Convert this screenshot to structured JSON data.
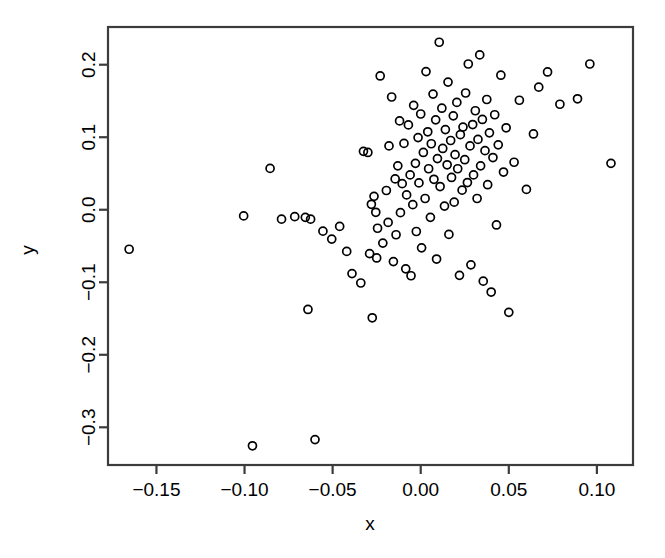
{
  "chart_data": {
    "type": "scatter",
    "title": "",
    "xlabel": "x",
    "ylabel": "y",
    "xlim": [
      -0.1775,
      0.1205
    ],
    "ylim": [
      -0.352,
      0.252
    ],
    "xticks": [
      -0.15,
      -0.1,
      -0.05,
      0.0,
      0.05,
      0.1
    ],
    "xtick_labels": [
      "-0.15",
      "-0.10",
      "-0.05",
      "0.00",
      "0.05",
      "0.10"
    ],
    "yticks": [
      0.2,
      0.1,
      0.0,
      -0.1,
      -0.2,
      -0.3
    ],
    "ytick_labels": [
      "0.2",
      "0.1",
      "0.0",
      "-0.1",
      "-0.2",
      "-0.3"
    ],
    "grid": false,
    "legend": false,
    "marker": "open-circle",
    "marker_size": 8,
    "marker_color": "#000000",
    "n_points": 121,
    "points": [
      [
        -0.1655,
        -0.0545
      ],
      [
        -0.1005,
        -0.0085
      ],
      [
        -0.0955,
        -0.3255
      ],
      [
        -0.0855,
        0.057
      ],
      [
        -0.079,
        -0.013
      ],
      [
        -0.0715,
        -0.0095
      ],
      [
        -0.0655,
        -0.0105
      ],
      [
        -0.064,
        -0.1375
      ],
      [
        -0.0625,
        -0.013
      ],
      [
        -0.06,
        -0.317
      ],
      [
        -0.0555,
        -0.0295
      ],
      [
        -0.0505,
        -0.0405
      ],
      [
        -0.046,
        -0.023
      ],
      [
        -0.042,
        -0.0575
      ],
      [
        -0.039,
        -0.088
      ],
      [
        -0.034,
        -0.101
      ],
      [
        -0.0325,
        0.0805
      ],
      [
        -0.03,
        0.079
      ],
      [
        -0.029,
        -0.0605
      ],
      [
        -0.028,
        0.0075
      ],
      [
        -0.0275,
        -0.149
      ],
      [
        -0.0265,
        0.0185
      ],
      [
        -0.0255,
        -0.0035
      ],
      [
        -0.025,
        -0.0665
      ],
      [
        -0.0245,
        -0.0255
      ],
      [
        -0.023,
        0.1845
      ],
      [
        -0.0215,
        -0.046
      ],
      [
        -0.0195,
        0.0265
      ],
      [
        -0.0185,
        -0.0175
      ],
      [
        -0.018,
        0.088
      ],
      [
        -0.0165,
        0.1555
      ],
      [
        -0.0155,
        -0.0715
      ],
      [
        -0.0145,
        0.0425
      ],
      [
        -0.014,
        -0.0345
      ],
      [
        -0.013,
        0.0605
      ],
      [
        -0.012,
        0.1225
      ],
      [
        -0.0115,
        -0.004
      ],
      [
        -0.0105,
        0.036
      ],
      [
        -0.0095,
        0.0915
      ],
      [
        -0.0085,
        -0.0815
      ],
      [
        -0.008,
        0.0205
      ],
      [
        -0.007,
        0.117
      ],
      [
        -0.006,
        0.048
      ],
      [
        -0.0055,
        -0.091
      ],
      [
        -0.0045,
        0.007
      ],
      [
        -0.004,
        0.144
      ],
      [
        -0.003,
        0.064
      ],
      [
        -0.0025,
        -0.03
      ],
      [
        -0.0015,
        0.0995
      ],
      [
        -0.001,
        0.037
      ],
      [
        0.0,
        0.132
      ],
      [
        0.0005,
        -0.0525
      ],
      [
        0.0015,
        0.079
      ],
      [
        0.0025,
        0.0155
      ],
      [
        0.003,
        0.1905
      ],
      [
        0.004,
        0.1075
      ],
      [
        0.0045,
        0.0565
      ],
      [
        0.0055,
        -0.0105
      ],
      [
        0.006,
        0.091
      ],
      [
        0.007,
        0.1595
      ],
      [
        0.0075,
        0.042
      ],
      [
        0.0085,
        0.124
      ],
      [
        0.009,
        -0.068
      ],
      [
        0.0095,
        0.0705
      ],
      [
        0.0105,
        0.231
      ],
      [
        0.011,
        0.032
      ],
      [
        0.012,
        0.14
      ],
      [
        0.0125,
        0.0845
      ],
      [
        0.0135,
        0.005
      ],
      [
        0.014,
        0.1105
      ],
      [
        0.015,
        0.062
      ],
      [
        0.0155,
        0.176
      ],
      [
        0.016,
        -0.034
      ],
      [
        0.017,
        0.0955
      ],
      [
        0.0175,
        0.0445
      ],
      [
        0.0185,
        0.1295
      ],
      [
        0.019,
        0.0105
      ],
      [
        0.0195,
        0.076
      ],
      [
        0.0205,
        0.148
      ],
      [
        0.021,
        0.0565
      ],
      [
        0.022,
        -0.0905
      ],
      [
        0.0225,
        0.1035
      ],
      [
        0.0235,
        0.027
      ],
      [
        0.024,
        0.114
      ],
      [
        0.025,
        0.069
      ],
      [
        0.0255,
        0.161
      ],
      [
        0.0265,
        0.0375
      ],
      [
        0.027,
        0.201
      ],
      [
        0.028,
        0.088
      ],
      [
        0.0285,
        -0.076
      ],
      [
        0.0295,
        0.1175
      ],
      [
        0.03,
        0.048
      ],
      [
        0.031,
        0.1365
      ],
      [
        0.032,
        0.0155
      ],
      [
        0.0325,
        0.097
      ],
      [
        0.0335,
        0.2135
      ],
      [
        0.034,
        0.0605
      ],
      [
        0.035,
        0.1245
      ],
      [
        0.0355,
        -0.0985
      ],
      [
        0.0365,
        0.0815
      ],
      [
        0.0375,
        0.152
      ],
      [
        0.038,
        0.0345
      ],
      [
        0.039,
        0.106
      ],
      [
        0.04,
        -0.1135
      ],
      [
        0.041,
        0.072
      ],
      [
        0.042,
        0.131
      ],
      [
        0.043,
        -0.021
      ],
      [
        0.044,
        0.0895
      ],
      [
        0.0455,
        0.1855
      ],
      [
        0.047,
        0.052
      ],
      [
        0.0485,
        0.113
      ],
      [
        0.05,
        -0.1415
      ],
      [
        0.053,
        0.0655
      ],
      [
        0.056,
        0.151
      ],
      [
        0.06,
        0.028
      ],
      [
        0.064,
        0.1045
      ],
      [
        0.067,
        0.169
      ],
      [
        0.072,
        0.19
      ],
      [
        0.079,
        0.1455
      ],
      [
        0.089,
        0.153
      ],
      [
        0.096,
        0.201
      ],
      [
        0.108,
        0.064
      ]
    ]
  },
  "axes": {
    "frame_color": "#3c3c3c",
    "background": "#ffffff"
  }
}
